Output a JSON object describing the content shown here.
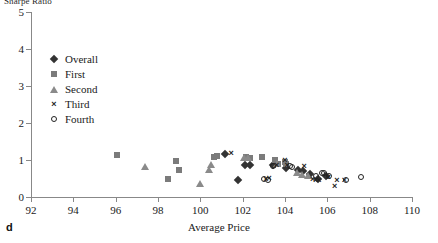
{
  "chart_data": {
    "type": "scatter",
    "title": "Sharpe Ratio",
    "ylabel": "Sharpe Ratio",
    "xlabel": "Average Price",
    "panel_label": "d",
    "xlim": [
      92,
      110
    ],
    "ylim": [
      0,
      5
    ],
    "xticks": [
      92,
      94,
      96,
      98,
      100,
      102,
      104,
      106,
      108,
      110
    ],
    "yticks": [
      0,
      1,
      2,
      3,
      4,
      5
    ],
    "grid": false,
    "legend_position": "upper-left",
    "series": [
      {
        "name": "Overall",
        "marker": "diamond",
        "color": "#333333",
        "points": [
          [
            101.15,
            1.16
          ],
          [
            101.8,
            0.46
          ],
          [
            102.1,
            0.87
          ],
          [
            102.35,
            0.87
          ],
          [
            103.55,
            0.88
          ],
          [
            104.6,
            0.72
          ],
          [
            104.85,
            0.7
          ],
          [
            105.2,
            0.62
          ],
          [
            105.55,
            0.48
          ],
          [
            105.95,
            0.58
          ],
          [
            103.45,
            0.86
          ],
          [
            104.05,
            0.79
          ]
        ]
      },
      {
        "name": "First",
        "marker": "square",
        "color": "#7b7b7b",
        "points": [
          [
            96.05,
            1.14
          ],
          [
            98.45,
            0.49
          ],
          [
            98.85,
            0.96
          ],
          [
            99.0,
            0.72
          ],
          [
            100.65,
            1.09
          ],
          [
            100.8,
            1.11
          ],
          [
            102.15,
            1.07
          ],
          [
            102.35,
            1.06
          ],
          [
            102.9,
            1.09
          ],
          [
            103.55,
            1.0
          ],
          [
            103.65,
            0.89
          ],
          [
            104.0,
            0.95
          ],
          [
            104.05,
            0.88
          ]
        ]
      },
      {
        "name": "Second",
        "marker": "triangle",
        "color": "#8a8a8a",
        "points": [
          [
            97.4,
            0.85
          ],
          [
            100.0,
            0.38
          ],
          [
            100.4,
            0.77
          ],
          [
            100.5,
            0.88
          ],
          [
            102.05,
            1.07
          ],
          [
            102.25,
            1.09
          ],
          [
            103.6,
            0.93
          ],
          [
            104.55,
            0.68
          ],
          [
            104.8,
            0.62
          ],
          [
            105.1,
            0.6
          ]
        ]
      },
      {
        "name": "Third",
        "marker": "cross",
        "color": "#222222",
        "points": [
          [
            101.45,
            1.18
          ],
          [
            103.1,
            0.5
          ],
          [
            103.25,
            0.51
          ],
          [
            104.0,
            1.01
          ],
          [
            104.1,
            0.87
          ],
          [
            104.9,
            0.85
          ],
          [
            105.3,
            0.5
          ],
          [
            105.45,
            0.47
          ],
          [
            105.6,
            0.45
          ],
          [
            106.05,
            0.55
          ],
          [
            106.35,
            0.3
          ],
          [
            106.45,
            0.47
          ],
          [
            106.8,
            0.45
          ],
          [
            103.6,
            0.86
          ]
        ]
      },
      {
        "name": "Fourth",
        "marker": "circle",
        "color": "#222222",
        "points": [
          [
            103.0,
            0.48
          ],
          [
            103.45,
            0.85
          ],
          [
            104.25,
            0.84
          ],
          [
            104.35,
            0.8
          ],
          [
            105.45,
            0.58
          ],
          [
            105.75,
            0.65
          ],
          [
            105.85,
            0.64
          ],
          [
            106.1,
            0.56
          ],
          [
            106.9,
            0.45
          ],
          [
            107.6,
            0.55
          ],
          [
            103.2,
            0.46
          ]
        ]
      }
    ]
  }
}
